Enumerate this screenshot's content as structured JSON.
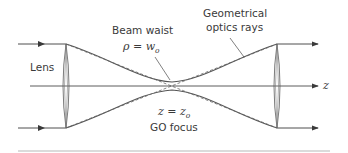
{
  "diagram": {
    "labels": {
      "lens": "Lens",
      "beam_waist": "Beam waist",
      "waist_eq_lhs": "ρ = w",
      "waist_eq_sub": "o",
      "go_rays_line1": "Geometrical",
      "go_rays_line2": "optics rays",
      "focus_eq_lhs": "z = z",
      "focus_eq_sub": "o",
      "go_focus": "GO focus",
      "axis": "z"
    },
    "colors": {
      "line": "#4a4a4a",
      "beam": "#5a5a5a",
      "dashed": "#6a6a6a",
      "footer_rule": "#b8b8b8"
    }
  }
}
